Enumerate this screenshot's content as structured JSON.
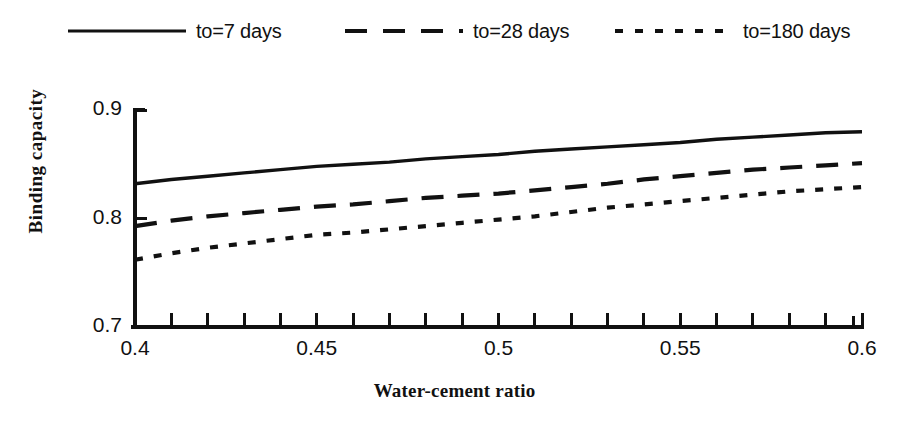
{
  "chart_data": {
    "type": "line",
    "title": "",
    "xlabel": "Water-cement ratio",
    "ylabel": "Binding capacity",
    "xlim": [
      0.4,
      0.6
    ],
    "ylim": [
      0.7,
      0.9
    ],
    "xticks": [
      0.4,
      0.45,
      0.5,
      0.55,
      0.6
    ],
    "xticklabels": [
      "0.4",
      "0.45",
      "0.5",
      "0.6",
      "0.6"
    ],
    "yticks": [
      0.7,
      0.8,
      0.9
    ],
    "yticklabels": [
      "0.7",
      "0.8",
      "0.9"
    ],
    "minor_xtick_step": 0.01,
    "grid": false,
    "legend_position": "above-plot",
    "x": [
      0.4,
      0.41,
      0.42,
      0.43,
      0.44,
      0.45,
      0.46,
      0.47,
      0.48,
      0.49,
      0.5,
      0.51,
      0.52,
      0.53,
      0.54,
      0.55,
      0.56,
      0.57,
      0.58,
      0.59,
      0.6
    ],
    "series": [
      {
        "name": "to=7 days",
        "style": "solid",
        "values": [
          0.832,
          0.836,
          0.839,
          0.842,
          0.845,
          0.848,
          0.85,
          0.852,
          0.855,
          0.857,
          0.859,
          0.862,
          0.864,
          0.866,
          0.868,
          0.87,
          0.873,
          0.875,
          0.877,
          0.879,
          0.88
        ]
      },
      {
        "name": "to=28 days",
        "style": "dashed",
        "values": [
          0.793,
          0.798,
          0.802,
          0.805,
          0.808,
          0.811,
          0.813,
          0.816,
          0.819,
          0.821,
          0.823,
          0.826,
          0.829,
          0.832,
          0.836,
          0.839,
          0.842,
          0.845,
          0.847,
          0.849,
          0.851
        ]
      },
      {
        "name": "to=180 days",
        "style": "dotted",
        "values": [
          0.762,
          0.768,
          0.773,
          0.777,
          0.781,
          0.785,
          0.787,
          0.79,
          0.793,
          0.796,
          0.799,
          0.802,
          0.806,
          0.81,
          0.813,
          0.816,
          0.819,
          0.822,
          0.825,
          0.827,
          0.829
        ]
      }
    ]
  },
  "legend": {
    "entries": [
      {
        "label": "to=7 days",
        "style": "solid"
      },
      {
        "label": "to=28 days",
        "style": "dashed"
      },
      {
        "label": "to=180 days",
        "style": "dotted"
      }
    ]
  },
  "axes": {
    "y": {
      "title": "Binding capacity",
      "ticks": [
        {
          "label": "0.9",
          "value": 0.9
        },
        {
          "label": "0.8",
          "value": 0.8
        },
        {
          "label": "0.7",
          "value": 0.7
        }
      ]
    },
    "x": {
      "title": "Water-cement ratio",
      "ticks": [
        {
          "label": "0.4",
          "value": 0.4
        },
        {
          "label": "0.45",
          "value": 0.45
        },
        {
          "label": "0.5",
          "value": 0.5
        },
        {
          "label": "0.55",
          "value": 0.55
        },
        {
          "label": "0.6",
          "value": 0.6
        }
      ]
    }
  },
  "colors": {
    "ink": "#111111",
    "background": "#ffffff"
  }
}
